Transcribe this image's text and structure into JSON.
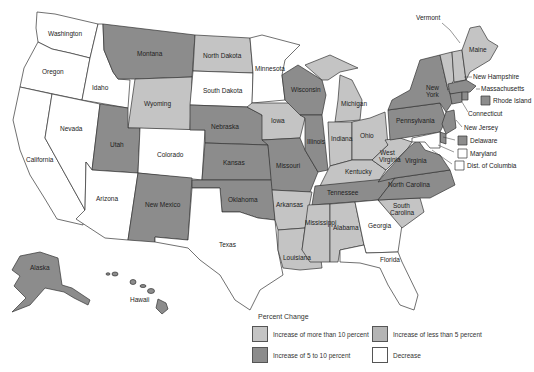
{
  "colors": {
    "more_than_10": "#c4c4c4",
    "five_to_10": "#8c8c8c",
    "less_than_5": "#b4b4b4",
    "decrease": "#ffffff"
  },
  "states": {
    "washington": {
      "label": "Washington",
      "category": "decrease"
    },
    "oregon": {
      "label": "Oregon",
      "category": "decrease"
    },
    "california": {
      "label": "California",
      "category": "decrease"
    },
    "idaho": {
      "label": "Idaho",
      "category": "decrease"
    },
    "nevada": {
      "label": "Nevada",
      "category": "decrease"
    },
    "montana": {
      "label": "Montana",
      "category": "five_to_10"
    },
    "wyoming": {
      "label": "Wyoming",
      "category": "more_than_10"
    },
    "utah": {
      "label": "Utah",
      "category": "five_to_10"
    },
    "colorado": {
      "label": "Colorado",
      "category": "decrease"
    },
    "arizona": {
      "label": "Arizona",
      "category": "decrease"
    },
    "new_mexico": {
      "label": "New Mexico",
      "category": "five_to_10"
    },
    "north_dakota": {
      "label": "North Dakota",
      "category": "more_than_10"
    },
    "south_dakota": {
      "label": "South Dakota",
      "category": "decrease"
    },
    "nebraska": {
      "label": "Nebraska",
      "category": "five_to_10"
    },
    "kansas": {
      "label": "Kansas",
      "category": "five_to_10"
    },
    "oklahoma": {
      "label": "Oklahoma",
      "category": "five_to_10"
    },
    "texas": {
      "label": "Texas",
      "category": "decrease"
    },
    "minnesota": {
      "label": "Minnesota",
      "category": "decrease"
    },
    "iowa": {
      "label": "Iowa",
      "category": "more_than_10"
    },
    "missouri": {
      "label": "Missouri",
      "category": "five_to_10"
    },
    "arkansas": {
      "label": "Arkansas",
      "category": "more_than_10"
    },
    "louisiana": {
      "label": "Louisiana",
      "category": "more_than_10"
    },
    "wisconsin": {
      "label": "Wisconsin",
      "category": "five_to_10"
    },
    "illinois": {
      "label": "Illinois",
      "category": "five_to_10"
    },
    "michigan": {
      "label": "Michigan",
      "category": "more_than_10"
    },
    "indiana": {
      "label": "Indiana",
      "category": "more_than_10"
    },
    "ohio": {
      "label": "Ohio",
      "category": "more_than_10"
    },
    "kentucky": {
      "label": "Kentucky",
      "category": "more_than_10"
    },
    "tennessee": {
      "label": "Tennessee",
      "category": "five_to_10"
    },
    "mississippi": {
      "label": "Mississippi",
      "category": "more_than_10"
    },
    "alabama": {
      "label": "Alabama",
      "category": "more_than_10"
    },
    "georgia": {
      "label": "Georgia",
      "category": "decrease"
    },
    "florida": {
      "label": "Florida",
      "category": "decrease"
    },
    "south_carolina": {
      "label": "South Carolina",
      "category": "more_than_10"
    },
    "north_carolina": {
      "label": "North Carolina",
      "category": "five_to_10"
    },
    "virginia": {
      "label": "Virginia",
      "category": "five_to_10"
    },
    "west_virginia": {
      "label": "West Virginia",
      "category": "more_than_10"
    },
    "pennsylvania": {
      "label": "Pennsylvania",
      "category": "five_to_10"
    },
    "new_york": {
      "label": "New York",
      "category": "five_to_10"
    },
    "vermont": {
      "label": "Vermont",
      "category": "more_than_10"
    },
    "new_hampshire": {
      "label": "New Hampshire",
      "category": "more_than_10"
    },
    "maine": {
      "label": "Maine",
      "category": "more_than_10"
    },
    "massachusetts": {
      "label": "Massachusetts",
      "category": "five_to_10"
    },
    "rhode_island": {
      "label": "Rhode Island",
      "category": "five_to_10"
    },
    "connecticut": {
      "label": "Connecticut",
      "category": "five_to_10"
    },
    "new_jersey": {
      "label": "New Jersey",
      "category": "five_to_10"
    },
    "delaware": {
      "label": "Delaware",
      "category": "five_to_10"
    },
    "maryland": {
      "label": "Maryland",
      "category": "decrease"
    },
    "dc": {
      "label": "Dist. of Columbia",
      "category": "decrease"
    },
    "alaska": {
      "label": "Alaska",
      "category": "five_to_10"
    },
    "hawaii": {
      "label": "Hawaii",
      "category": "five_to_10"
    }
  },
  "legend": {
    "title": "Percent Change",
    "items": [
      {
        "key": "more_than_10",
        "label": "Increase of more than 10 percent"
      },
      {
        "key": "less_than_5",
        "label": "Increase of less than 5 percent"
      },
      {
        "key": "five_to_10",
        "label": "Increase of 5 to 10 percent"
      },
      {
        "key": "decrease",
        "label": "Decrease"
      }
    ]
  }
}
